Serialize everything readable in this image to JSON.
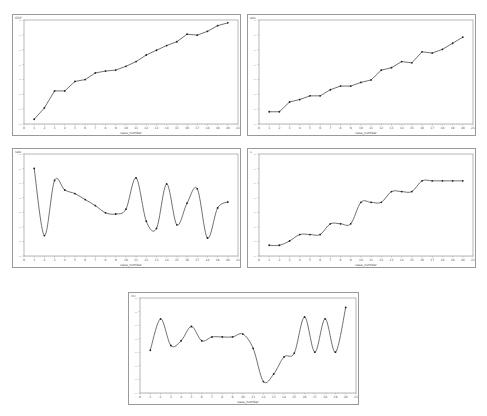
{
  "chart_data": [
    {
      "type": "line",
      "panel": {
        "x": 12,
        "y": 14,
        "w": 229,
        "h": 122
      },
      "ylabel": "GDP",
      "xlabel": "case_number",
      "xlim": [
        0,
        21
      ],
      "ylim": [
        0,
        100
      ],
      "x": [
        1,
        2,
        3,
        4,
        5,
        6,
        7,
        8,
        9,
        10,
        11,
        12,
        13,
        14,
        15,
        16,
        17,
        18,
        19,
        20
      ],
      "values": [
        10,
        22,
        40,
        40,
        50,
        52,
        59,
        61,
        62,
        66,
        71,
        78,
        83,
        88,
        92,
        100,
        99,
        103,
        109,
        112
      ],
      "scale": [
        5,
        115
      ],
      "smooth": false
    },
    {
      "type": "line",
      "panel": {
        "x": 247,
        "y": 14,
        "w": 229,
        "h": 122
      },
      "ylabel": "edu",
      "xlabel": "case_number",
      "xlim": [
        0,
        21
      ],
      "x": [
        1,
        2,
        3,
        4,
        5,
        6,
        7,
        8,
        9,
        10,
        11,
        12,
        13,
        14,
        15,
        16,
        17,
        18,
        19,
        20
      ],
      "values": [
        20,
        20,
        28,
        30,
        33,
        33,
        38,
        41,
        41,
        44,
        46,
        54,
        56,
        61,
        60,
        69,
        68,
        71,
        76,
        81
      ],
      "scale": [
        10,
        95
      ],
      "smooth": false
    },
    {
      "type": "line",
      "panel": {
        "x": 12,
        "y": 148,
        "w": 229,
        "h": 120
      },
      "ylabel": "rate",
      "xlabel": "case_number",
      "xlim": [
        0,
        21
      ],
      "x": [
        1,
        2,
        3,
        4,
        5,
        6,
        7,
        8,
        9,
        10,
        11,
        12,
        13,
        14,
        15,
        16,
        17,
        18,
        19,
        20
      ],
      "values": [
        88,
        32,
        78,
        70,
        67,
        62,
        57,
        51,
        50,
        54,
        80,
        44,
        38,
        75,
        41,
        59,
        71,
        30,
        55,
        60
      ],
      "scale": [
        15,
        100
      ],
      "smooth": true
    },
    {
      "type": "line",
      "panel": {
        "x": 247,
        "y": 148,
        "w": 229,
        "h": 120
      },
      "ylabel": "s",
      "xlabel": "case_number",
      "xlim": [
        0,
        21
      ],
      "x": [
        1,
        2,
        3,
        4,
        5,
        6,
        7,
        8,
        9,
        10,
        11,
        12,
        13,
        14,
        15,
        16,
        17,
        18,
        19,
        20
      ],
      "values": [
        10,
        10,
        14,
        20,
        20,
        20,
        30,
        30,
        30,
        50,
        50,
        50,
        60,
        60,
        60,
        70,
        70,
        70,
        70,
        70
      ],
      "scale": [
        0,
        95
      ],
      "smooth": true
    },
    {
      "type": "line",
      "panel": {
        "x": 128,
        "y": 292,
        "w": 231,
        "h": 113
      },
      "ylabel": "inv",
      "xlabel": "case_number",
      "xlim": [
        0,
        21
      ],
      "x": [
        1,
        2,
        3,
        4,
        5,
        6,
        7,
        8,
        9,
        10,
        11,
        12,
        13,
        14,
        15,
        16,
        17,
        18,
        19,
        20
      ],
      "values": [
        45,
        78,
        50,
        55,
        70,
        55,
        59,
        59,
        59,
        62,
        47,
        12,
        20,
        38,
        42,
        80,
        43,
        78,
        43,
        90
      ],
      "scale": [
        0,
        100
      ],
      "smooth": true
    }
  ]
}
